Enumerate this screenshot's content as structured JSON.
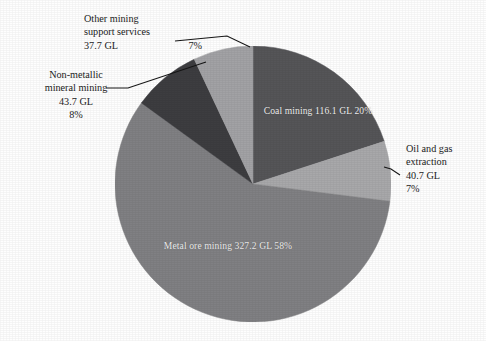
{
  "chart_data": {
    "type": "pie",
    "title": "",
    "unit": "GL",
    "legend_position": "none",
    "total_value": 565.4,
    "center": {
      "x": 253,
      "y": 184,
      "radius": 138
    },
    "categories": [
      "Coal mining",
      "Oil and gas extraction",
      "Metal ore mining",
      "Non-metallic mineral mining",
      "Other mining support services"
    ],
    "values": [
      116.1,
      40.7,
      327.2,
      43.7,
      37.7
    ],
    "percentages": [
      20,
      7,
      58,
      8,
      7
    ],
    "colors": [
      "#555558",
      "#a8a8aa",
      "#808083",
      "#3d3d40",
      "#a2a2a5"
    ],
    "slices": [
      {
        "name": "coal-mining",
        "label": "Coal mining",
        "value_text": "116.1 GL",
        "percent_text": "20%",
        "value": 116.1,
        "percent": 20,
        "color": "#555558",
        "start_deg": 0,
        "sweep_deg": 72,
        "label_placement": "inside"
      },
      {
        "name": "oil-and-gas-extraction",
        "label_line_1": "Oil and gas",
        "label_line_2": "extraction",
        "value_text": "40.7 GL",
        "percent_text": "7%",
        "value": 40.7,
        "percent": 7,
        "color": "#a8a8aa",
        "start_deg": 72,
        "sweep_deg": 25.2,
        "label_placement": "callout-right"
      },
      {
        "name": "metal-ore-mining",
        "label": "Metal ore mining",
        "value_text": "327.2 GL",
        "percent_text": "58%",
        "value": 327.2,
        "percent": 58,
        "color": "#808083",
        "start_deg": 97.2,
        "sweep_deg": 208.8,
        "label_placement": "inside"
      },
      {
        "name": "non-metallic-mineral-mining",
        "label_line_1": "Non-metallic",
        "label_line_2": "mineral mining",
        "value_text": "43.7 GL",
        "percent_text": "8%",
        "value": 43.7,
        "percent": 8,
        "color": "#3d3d40",
        "start_deg": 306,
        "sweep_deg": 28.8,
        "label_placement": "callout-left"
      },
      {
        "name": "other-mining-support-services",
        "label_line_1": "Other mining",
        "label_line_2": "support services",
        "value_text": "37.7 GL",
        "percent_text": "7%",
        "value": 37.7,
        "percent": 7,
        "color": "#a2a2a5",
        "start_deg": 334.8,
        "sweep_deg": 25.2,
        "label_placement": "callout-top-left"
      }
    ]
  },
  "labels": {
    "coal": {
      "line1": "Coal mining",
      "line2": "116.1 GL",
      "line3": "20%"
    },
    "metal": {
      "line1": "Metal ore mining",
      "line2": "327.2 GL",
      "line3": "58%"
    },
    "oil": {
      "line1": "Oil and gas",
      "line2": "extraction",
      "line3": "40.7 GL",
      "line4": "7%"
    },
    "nonmetallic": {
      "line1": "Non-metallic",
      "line2": "mineral mining",
      "line3": "43.7 GL",
      "line4": "8%"
    },
    "other": {
      "line1": "Other mining",
      "line2": "support services",
      "line3": "37.7 GL",
      "line4": "7%"
    }
  }
}
